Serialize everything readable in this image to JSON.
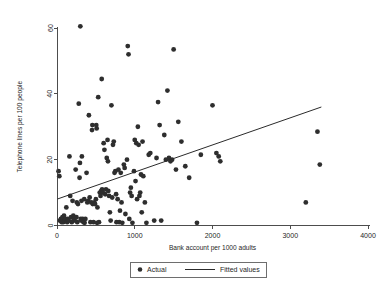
{
  "chart_data": {
    "type": "scatter",
    "title": "",
    "xlabel": "Bank account per 1000 adults",
    "ylabel": "Telephone lines per 100 people",
    "xlim": [
      0,
      4000
    ],
    "ylim": [
      0,
      60
    ],
    "xticks": [
      0,
      1000,
      2000,
      3000,
      4000
    ],
    "yticks": [
      0,
      20,
      40,
      60
    ],
    "xtick_labels": [
      "0",
      "1000",
      "2000",
      "3000",
      "4000"
    ],
    "ytick_labels": [
      "0",
      "20",
      "40",
      "60"
    ],
    "grid": false,
    "legend_position": "bottom-center",
    "series": [
      {
        "name": "Actual",
        "type": "scatter",
        "marker": "filled-circle",
        "color": "#2e2e2e",
        "points": [
          [
            20,
            16.5
          ],
          [
            30,
            15.0
          ],
          [
            35,
            1.5
          ],
          [
            50,
            2.0
          ],
          [
            60,
            1.0
          ],
          [
            70,
            2.5
          ],
          [
            80,
            1.0
          ],
          [
            90,
            3.0
          ],
          [
            100,
            1.5
          ],
          [
            110,
            2.0
          ],
          [
            120,
            5.5
          ],
          [
            130,
            1.0
          ],
          [
            140,
            2.0
          ],
          [
            150,
            1.5
          ],
          [
            160,
            21.0
          ],
          [
            170,
            9.0
          ],
          [
            180,
            2.5
          ],
          [
            190,
            1.0
          ],
          [
            200,
            7.5
          ],
          [
            210,
            3.0
          ],
          [
            215,
            1.5
          ],
          [
            225,
            2.0
          ],
          [
            240,
            17.0
          ],
          [
            250,
            2.5
          ],
          [
            255,
            7.0
          ],
          [
            260,
            1.0
          ],
          [
            270,
            6.5
          ],
          [
            280,
            37.0
          ],
          [
            290,
            14.5
          ],
          [
            295,
            19.0
          ],
          [
            300,
            60.5
          ],
          [
            305,
            2.0
          ],
          [
            310,
            1.5
          ],
          [
            315,
            7.5
          ],
          [
            320,
            21.0
          ],
          [
            330,
            2.0
          ],
          [
            340,
            1.0
          ],
          [
            350,
            8.0
          ],
          [
            355,
            0.8
          ],
          [
            365,
            2.0
          ],
          [
            380,
            16.0
          ],
          [
            390,
            7.0
          ],
          [
            400,
            7.5
          ],
          [
            410,
            33.5
          ],
          [
            420,
            8.5
          ],
          [
            430,
            1.0
          ],
          [
            440,
            7.0
          ],
          [
            450,
            29.0
          ],
          [
            455,
            30.5
          ],
          [
            460,
            6.5
          ],
          [
            470,
            1.0
          ],
          [
            480,
            7.0
          ],
          [
            490,
            6.5
          ],
          [
            500,
            8.0
          ],
          [
            505,
            30.5
          ],
          [
            510,
            29.5
          ],
          [
            515,
            0.8
          ],
          [
            520,
            5.5
          ],
          [
            530,
            39.0
          ],
          [
            540,
            1.0
          ],
          [
            550,
            10.0
          ],
          [
            560,
            9.0
          ],
          [
            570,
            10.5
          ],
          [
            575,
            44.5
          ],
          [
            580,
            11.0
          ],
          [
            590,
            10.0
          ],
          [
            600,
            25.0
          ],
          [
            610,
            23.0
          ],
          [
            620,
            9.5
          ],
          [
            630,
            11.0
          ],
          [
            640,
            20.5
          ],
          [
            650,
            26.0
          ],
          [
            655,
            19.5
          ],
          [
            660,
            10.5
          ],
          [
            670,
            9.0
          ],
          [
            680,
            4.0
          ],
          [
            690,
            1.5
          ],
          [
            700,
            36.5
          ],
          [
            710,
            8.5
          ],
          [
            720,
            24.5
          ],
          [
            730,
            25.5
          ],
          [
            740,
            16.0
          ],
          [
            750,
            16.5
          ],
          [
            760,
            9.5
          ],
          [
            765,
            1.0
          ],
          [
            780,
            8.0
          ],
          [
            790,
            17.0
          ],
          [
            800,
            1.0
          ],
          [
            810,
            4.5
          ],
          [
            820,
            16.0
          ],
          [
            830,
            7.0
          ],
          [
            840,
            0.8
          ],
          [
            860,
            18.5
          ],
          [
            870,
            17.5
          ],
          [
            880,
            3.5
          ],
          [
            900,
            20.0
          ],
          [
            910,
            54.5
          ],
          [
            920,
            52.0
          ],
          [
            930,
            2.0
          ],
          [
            940,
            10.0
          ],
          [
            950,
            11.5
          ],
          [
            960,
            9.0
          ],
          [
            970,
            0.8
          ],
          [
            990,
            16.5
          ],
          [
            1000,
            26.0
          ],
          [
            1010,
            13.5
          ],
          [
            1020,
            25.0
          ],
          [
            1030,
            8.0
          ],
          [
            1040,
            30.0
          ],
          [
            1050,
            24.5
          ],
          [
            1060,
            9.0
          ],
          [
            1070,
            10.0
          ],
          [
            1080,
            15.5
          ],
          [
            1090,
            4.0
          ],
          [
            1100,
            25.5
          ],
          [
            1110,
            15.0
          ],
          [
            1130,
            7.0
          ],
          [
            1150,
            0.8
          ],
          [
            1180,
            21.5
          ],
          [
            1200,
            22.0
          ],
          [
            1250,
            1.5
          ],
          [
            1280,
            20.5
          ],
          [
            1300,
            37.5
          ],
          [
            1320,
            30.5
          ],
          [
            1340,
            1.5
          ],
          [
            1380,
            27.5
          ],
          [
            1400,
            20.0
          ],
          [
            1420,
            41.0
          ],
          [
            1440,
            20.5
          ],
          [
            1460,
            19.5
          ],
          [
            1480,
            20.0
          ],
          [
            1500,
            53.5
          ],
          [
            1530,
            17.0
          ],
          [
            1560,
            31.5
          ],
          [
            1600,
            25.5
          ],
          [
            1650,
            18.0
          ],
          [
            1700,
            14.5
          ],
          [
            1800,
            0.8
          ],
          [
            1850,
            21.5
          ],
          [
            2000,
            36.5
          ],
          [
            2050,
            22.0
          ],
          [
            2080,
            21.0
          ],
          [
            2100,
            19.5
          ],
          [
            3200,
            7.0
          ],
          [
            3350,
            28.5
          ],
          [
            3380,
            18.5
          ]
        ]
      },
      {
        "name": "Fitted values",
        "type": "line",
        "color": "#2b2b2b",
        "endpoints": [
          [
            0,
            8.0
          ],
          [
            3400,
            36.0
          ]
        ]
      }
    ],
    "legend_entries": [
      {
        "label": "Actual",
        "marker": "filled-circle"
      },
      {
        "label": "Fitted values",
        "marker": "line"
      }
    ]
  }
}
